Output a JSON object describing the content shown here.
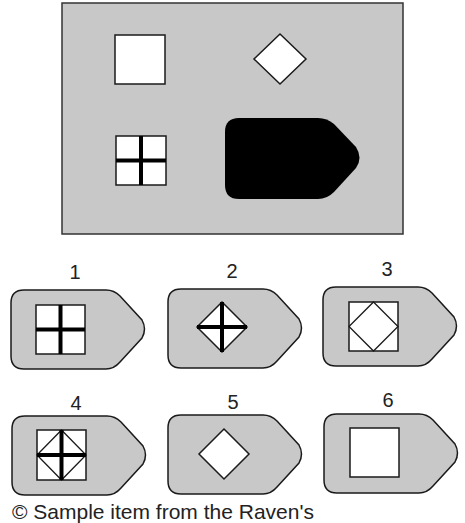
{
  "colors": {
    "panel_gray": "#c8c8c8",
    "stroke": "#1a1a1a",
    "fill_white": "#ffffff",
    "solid_black": "#000000"
  },
  "matrix": {
    "cells": [
      {
        "position": "top-left",
        "figure": "square"
      },
      {
        "position": "top-right",
        "figure": "diamond"
      },
      {
        "position": "bottom-left",
        "figure": "square-with-cross"
      },
      {
        "position": "bottom-right",
        "figure": "missing-piece-black-pentagon"
      }
    ]
  },
  "options": [
    {
      "label": "1",
      "figure": "square-with-cross"
    },
    {
      "label": "2",
      "figure": "diamond-with-cross"
    },
    {
      "label": "3",
      "figure": "diamond-inside-square"
    },
    {
      "label": "4",
      "figure": "square-with-diamond-and-cross"
    },
    {
      "label": "5",
      "figure": "diamond"
    },
    {
      "label": "6",
      "figure": "square"
    }
  ],
  "caption": "© Sample item from the Raven's"
}
